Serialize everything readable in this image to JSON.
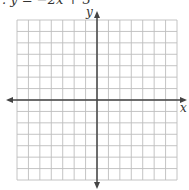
{
  "equation": ". y = −2x + 3",
  "axes": {
    "x_label": "x",
    "y_label": "y"
  },
  "grid": {
    "columns": 14,
    "rows": 14,
    "line_color": "#b8b8b8",
    "axis_color": "#444444"
  }
}
